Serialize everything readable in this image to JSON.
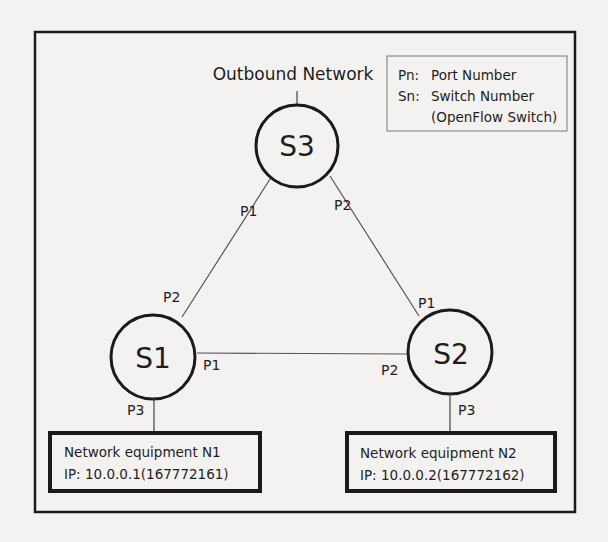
{
  "diagram": {
    "outbound_label": "Outbound Network",
    "legend": {
      "line1_key": "Pn:",
      "line1_value": "Port Number",
      "line2_key": "Sn:",
      "line2_value": "Switch Number",
      "line3_value": "(OpenFlow Switch)"
    },
    "switches": [
      {
        "id": "S3",
        "label": "S3"
      },
      {
        "id": "S1",
        "label": "S1"
      },
      {
        "id": "S2",
        "label": "S2"
      }
    ],
    "ports": {
      "s3_p3": "P3",
      "s3_p1": "P1",
      "s3_p2": "P2",
      "s1_p2": "P2",
      "s1_p1": "P1",
      "s1_p3": "P3",
      "s2_p1": "P1",
      "s2_p2": "P2",
      "s2_p3": "P3"
    },
    "equipment": [
      {
        "name": "Network equipment N1",
        "ip": "IP: 10.0.0.1(167772161)"
      },
      {
        "name": "Network equipment N2",
        "ip": "IP: 10.0.0.2(167772162)"
      }
    ],
    "colors": {
      "background": "#f3f2f0",
      "stroke": "#1a1a1a",
      "link": "#555555"
    }
  }
}
